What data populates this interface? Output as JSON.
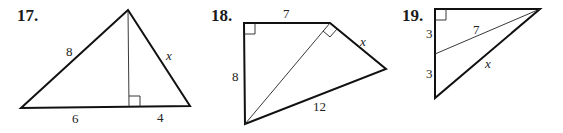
{
  "problems": [
    {
      "number": "17.",
      "description": "Triangle with altitude from apex to base; left side 8, right side x, base split into 6 and 4 with right angle at altitude foot",
      "labels": {
        "left_side": "8",
        "right_side": "x",
        "base_left": "6",
        "base_right": "4"
      }
    },
    {
      "number": "18.",
      "description": "Quadrilateral split by diagonal into two right triangles; top 7, left 8, right-upper side x, bottom 12; right angles at top-left and at top-right between diagonal and x",
      "labels": {
        "top": "7",
        "left": "8",
        "right_upper": "x",
        "bottom": "12"
      }
    },
    {
      "number": "19.",
      "description": "Right triangle with right angle at top-left; left leg split into 3 and 3; segment of length 7 from midpoint of left leg to top-right vertex; hypotenuse x",
      "labels": {
        "upper_left": "3",
        "lower_left": "3",
        "inner_segment": "7",
        "hypotenuse": "x"
      }
    }
  ]
}
